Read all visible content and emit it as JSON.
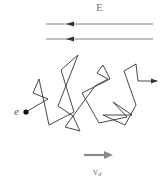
{
  "diagram": {
    "field_label": "E",
    "electron_label": "e",
    "drift_label_main": "v",
    "drift_label_sub": "d",
    "colors": {
      "field_lines": "#555555",
      "path": "#333333",
      "electron": "#111111",
      "drift_arrow": "#888888",
      "labels": "#777777"
    },
    "field_lines": [
      {
        "x1": 153,
        "y1": 24,
        "x2": 46,
        "y2": 24,
        "direction": "left"
      },
      {
        "x1": 153,
        "y1": 39,
        "x2": 46,
        "y2": 39,
        "direction": "left"
      }
    ],
    "electron_position": [
      26,
      112
    ],
    "path_points": [
      [
        26,
        112
      ],
      [
        48,
        99
      ],
      [
        33,
        93
      ],
      [
        39,
        79
      ],
      [
        49,
        125
      ],
      [
        74,
        112
      ],
      [
        61,
        70
      ],
      [
        78,
        55
      ],
      [
        58,
        106
      ],
      [
        73,
        116
      ],
      [
        80,
        131
      ],
      [
        65,
        127
      ],
      [
        95,
        86
      ],
      [
        108,
        79
      ],
      [
        97,
        73
      ],
      [
        103,
        65
      ],
      [
        110,
        79
      ],
      [
        82,
        93
      ],
      [
        99,
        123
      ],
      [
        127,
        117
      ],
      [
        113,
        102
      ],
      [
        132,
        115
      ],
      [
        103,
        115
      ],
      [
        125,
        125
      ],
      [
        136,
        105
      ],
      [
        124,
        71
      ],
      [
        136,
        64
      ],
      [
        138,
        81
      ],
      [
        157,
        81
      ]
    ],
    "drift_arrow": {
      "x1": 84,
      "y1": 155,
      "x2": 112,
      "y2": 155
    }
  }
}
